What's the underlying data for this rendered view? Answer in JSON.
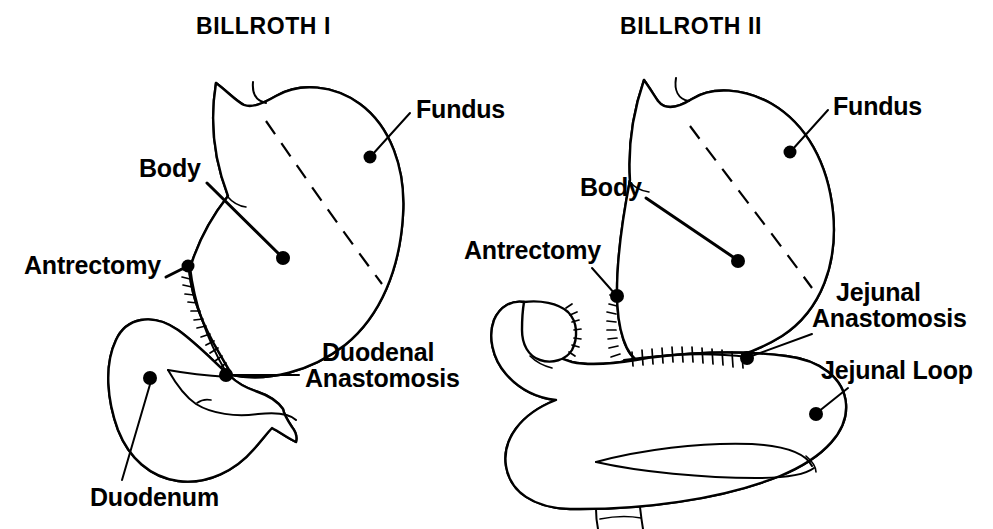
{
  "figure": {
    "kind": "medical-illustration",
    "background_color": "#ffffff",
    "ink_color": "#000000",
    "panel_count": 2
  },
  "panels": [
    {
      "id": "billroth-1",
      "title": "BILLROTH I",
      "title_x": 196,
      "title_y": 34,
      "labels": [
        {
          "key": "fundus",
          "text": "Fundus",
          "text_x": 416,
          "text_y": 118,
          "anchor_x": 370,
          "anchor_y": 157,
          "leader": "M 410 113 L 372 155"
        },
        {
          "key": "body",
          "text": "Body",
          "text_x": 139,
          "text_y": 177,
          "anchor_x": 283,
          "anchor_y": 258,
          "leader": "M 207 183 L 281 256"
        },
        {
          "key": "antrectomy",
          "text": "Antrectomy",
          "text_x": 24,
          "text_y": 274,
          "anchor_x": 188,
          "anchor_y": 266,
          "leader": "M 166 277 L 186 267"
        },
        {
          "key": "duodenal-anastomosis",
          "text_lines": [
            "Duodenal",
            "Anastomosis"
          ],
          "text_x": 305,
          "text_y": 361,
          "text_y2": 387,
          "anchor_x": 226,
          "anchor_y": 375,
          "leader": "M 299 375 L 228 375"
        },
        {
          "key": "duodenum",
          "text": "Duodenum",
          "text_x": 90,
          "text_y": 506,
          "anchor_x": 150,
          "anchor_y": 378,
          "leader": "M 122 480 L 151 381"
        }
      ]
    },
    {
      "id": "billroth-2",
      "title": "BILLROTH II",
      "title_x": 620,
      "title_y": 34,
      "labels": [
        {
          "key": "fundus",
          "text": "Fundus",
          "text_x": 833,
          "text_y": 115,
          "anchor_x": 790,
          "anchor_y": 152,
          "leader": "M 828 110 L 792 150"
        },
        {
          "key": "body",
          "text": "Body",
          "text_x": 580,
          "text_y": 196,
          "anchor_x": 738,
          "anchor_y": 261,
          "leader": "M 646 198 L 736 259"
        },
        {
          "key": "antrectomy",
          "text": "Antrectomy",
          "text_x": 464,
          "text_y": 259,
          "anchor_x": 617,
          "anchor_y": 296,
          "leader": "M 592 268 L 615 294"
        },
        {
          "key": "jejunal-anastomosis",
          "text_lines": [
            "Jejunal",
            "Anastomosis"
          ],
          "text_x": 836,
          "text_y": 301,
          "text_x2": 812,
          "text_y2": 327,
          "anchor_x": 747,
          "anchor_y": 358,
          "leader": "M 812 334 L 749 357"
        },
        {
          "key": "jejunal-loop",
          "text": "Jejunal Loop",
          "text_x": 821,
          "text_y": 379,
          "anchor_x": 816,
          "anchor_y": 414,
          "leader": "M 848 388 L 818 412"
        }
      ]
    }
  ],
  "anatomy_terms": [
    "Fundus",
    "Body",
    "Antrectomy",
    "Duodenal Anastomosis",
    "Duodenum",
    "Jejunal Anastomosis",
    "Jejunal Loop"
  ]
}
